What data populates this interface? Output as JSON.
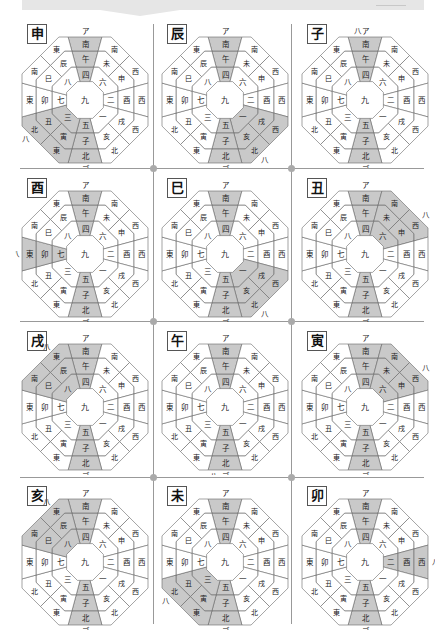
{
  "page": {
    "top_tag": ""
  },
  "colors": {
    "shade": "#c9c9c9",
    "line": "#666666",
    "text": "#222222",
    "grid_line": "#999999",
    "dot": "#aaaaaa"
  },
  "compass": {
    "top_mark": "ア",
    "bottom_mark": "ゴ",
    "highlight_mark": "八",
    "center": "九",
    "cardinals": {
      "S": {
        "outer": "南",
        "middle": "午",
        "inner": "四"
      },
      "W": {
        "outer": "西",
        "middle": "酉",
        "inner": "二"
      },
      "N": {
        "outer": "北",
        "middle": "子",
        "inner": "五"
      },
      "E": {
        "outer": "東",
        "middle": "卯",
        "inner": "七"
      }
    },
    "diagonals": {
      "SE": {
        "outer": [
          "南",
          "東"
        ],
        "middle": [
          "巳",
          "辰"
        ],
        "inner": "八"
      },
      "SW": {
        "outer": [
          "南",
          "西"
        ],
        "middle": [
          "未",
          "申"
        ],
        "inner": "六"
      },
      "NW": {
        "outer": [
          "西",
          "北"
        ],
        "middle": [
          "戌",
          "亥"
        ],
        "inner": "一"
      },
      "NE": {
        "outer": [
          "東",
          "北"
        ],
        "middle": [
          "寅",
          "丑"
        ],
        "inner": "三"
      }
    }
  },
  "panels": [
    {
      "title": "申",
      "highlight": "NE",
      "mark_pos": "NE"
    },
    {
      "title": "辰",
      "highlight": "NW",
      "mark_pos": "NW"
    },
    {
      "title": "子",
      "highlight": "S",
      "mark_pos": "S"
    },
    {
      "title": "酉",
      "highlight": "E",
      "mark_pos": "E"
    },
    {
      "title": "巳",
      "highlight": "NW",
      "mark_pos": "NW"
    },
    {
      "title": "丑",
      "highlight": "SW",
      "mark_pos": "SW"
    },
    {
      "title": "戌",
      "highlight": "SE",
      "mark_pos": "SE"
    },
    {
      "title": "午",
      "highlight": "N",
      "mark_pos": "N"
    },
    {
      "title": "寅",
      "highlight": "SW",
      "mark_pos": "SW"
    },
    {
      "title": "亥",
      "highlight": "SE",
      "mark_pos": "SE"
    },
    {
      "title": "未",
      "highlight": "NE",
      "mark_pos": "NE"
    },
    {
      "title": "卯",
      "highlight": "W",
      "mark_pos": "W"
    }
  ]
}
